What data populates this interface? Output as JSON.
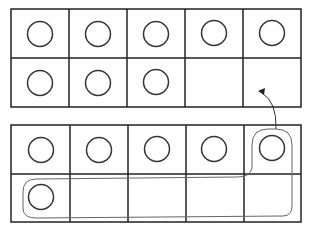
{
  "diagram": {
    "type": "ten-frames",
    "colors": {
      "grid": "#222222",
      "counter": "#333333",
      "path": "#666666",
      "background": "#ffffff"
    },
    "frames": [
      {
        "id": "top-frame",
        "rows": 2,
        "cols": 5,
        "filled": [
          [
            1,
            1,
            1,
            1,
            1
          ],
          [
            1,
            1,
            1,
            0,
            0
          ]
        ],
        "count": 8
      },
      {
        "id": "bottom-frame",
        "rows": 2,
        "cols": 5,
        "filled": [
          [
            1,
            1,
            1,
            1,
            1
          ],
          [
            1,
            0,
            0,
            0,
            0
          ]
        ],
        "count": 6
      }
    ],
    "annotations": [
      {
        "type": "loop",
        "encloses": "bottom-frame counters at row1-col5 and row2-col1",
        "count": 2
      },
      {
        "type": "arrow",
        "from": "bottom-frame loop",
        "to": "top-frame row2-col5"
      }
    ]
  }
}
